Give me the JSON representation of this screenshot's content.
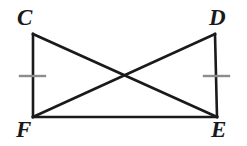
{
  "figure": {
    "background_color": "#ffffff",
    "stroke_color": "#1a1a1a",
    "tick_color": "#8c8c8c",
    "stroke_width": 2.6,
    "tick_width": 2.4,
    "width": 247,
    "height": 146
  },
  "vertices": [
    {
      "name": "C",
      "label": "C",
      "x": 33,
      "y": 34,
      "position": "top-left"
    },
    {
      "name": "D",
      "label": "D",
      "x": 215,
      "y": 34,
      "position": "top-right"
    },
    {
      "name": "F",
      "label": "F",
      "x": 33,
      "y": 117,
      "position": "bottom-left"
    },
    {
      "name": "E",
      "label": "E",
      "x": 217,
      "y": 117,
      "position": "bottom-right"
    }
  ],
  "segments": [
    {
      "name": "segment-CF",
      "label": "CF",
      "from": "C",
      "to": "F",
      "x1": 33,
      "y1": 34,
      "x2": 33,
      "y2": 117,
      "kind": "side"
    },
    {
      "name": "segment-DE",
      "label": "DE",
      "from": "D",
      "to": "E",
      "x1": 215,
      "y1": 34,
      "x2": 217,
      "y2": 117,
      "kind": "side"
    },
    {
      "name": "segment-FE",
      "label": "FE",
      "from": "F",
      "to": "E",
      "x1": 33,
      "y1": 117,
      "x2": 217,
      "y2": 117,
      "kind": "base"
    },
    {
      "name": "segment-CE",
      "label": "CE",
      "from": "C",
      "to": "E",
      "x1": 33,
      "y1": 34,
      "x2": 217,
      "y2": 117,
      "kind": "diagonal"
    },
    {
      "name": "segment-DF",
      "label": "DF",
      "from": "D",
      "to": "F",
      "x1": 215,
      "y1": 34,
      "x2": 33,
      "y2": 117,
      "kind": "diagonal"
    }
  ],
  "tick_marks": [
    {
      "name": "tick-CF",
      "on_segment": "CF",
      "count": 1,
      "x1": 20,
      "y1": 76,
      "x2": 45,
      "y2": 76
    },
    {
      "name": "tick-DE",
      "on_segment": "DE",
      "count": 1,
      "x1": 204,
      "y1": 76,
      "x2": 229,
      "y2": 76
    }
  ],
  "intersection": {
    "name": "diagonal-intersection",
    "x": 125,
    "y": 76
  },
  "labels": {
    "C": "C",
    "D": "D",
    "F": "F",
    "E": "E"
  }
}
